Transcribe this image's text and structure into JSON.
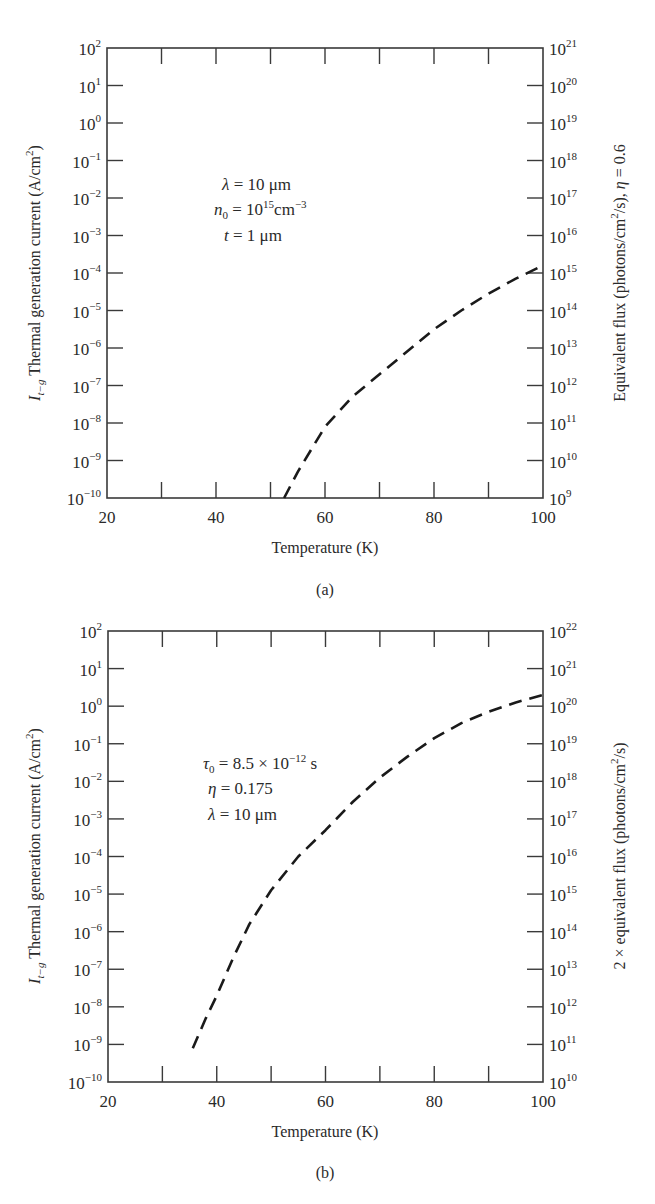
{
  "chart_data": [
    {
      "id": "a",
      "type": "line",
      "caption": "(a)",
      "xlabel": "Temperature (K)",
      "ylabel": "I_{t-g} Thermal generation current (A/cm^2)",
      "ylabel_right": "Equivalent flux (photons/cm^2/s), η = 0.6",
      "xlim": [
        20,
        100
      ],
      "ylim_log10": [
        -10,
        2
      ],
      "ylim_right_log10": [
        9,
        21
      ],
      "yscale": "log",
      "x_ticks": [
        20,
        40,
        60,
        80,
        100
      ],
      "x_minor_ticks": [
        30,
        50,
        70,
        90
      ],
      "y_tick_exponents": [
        2,
        1,
        0,
        -1,
        -2,
        -3,
        -4,
        -5,
        -6,
        -7,
        -8,
        -9,
        -10
      ],
      "y_right_tick_exponents": [
        21,
        20,
        19,
        18,
        17,
        16,
        15,
        14,
        13,
        12,
        11,
        10,
        9
      ],
      "annotations": [
        "λ = 10 μm",
        "n₀ = 10¹⁵ cm⁻³",
        "t = 1 μm"
      ],
      "series": [
        {
          "name": "thermal generation current",
          "style": "dashed",
          "x": [
            52.5,
            55,
            60,
            65,
            70,
            75,
            80,
            85,
            90,
            95,
            100
          ],
          "log10_y": [
            -10.0,
            -9.3,
            -8.1,
            -7.3,
            -6.7,
            -6.1,
            -5.5,
            -5.0,
            -4.55,
            -4.15,
            -3.8
          ]
        }
      ],
      "grid": false
    },
    {
      "id": "b",
      "type": "line",
      "caption": "(b)",
      "xlabel": "Temperature (K)",
      "ylabel": "I_{t-g} Thermal generation current (A/cm^2)",
      "ylabel_right": "2 × equivalent flux (photons/cm^2/s)",
      "xlim": [
        20,
        100
      ],
      "ylim_log10": [
        -10,
        2
      ],
      "ylim_right_log10": [
        10,
        22
      ],
      "yscale": "log",
      "x_ticks": [
        20,
        40,
        60,
        80,
        100
      ],
      "x_minor_ticks": [
        30,
        50,
        70,
        90
      ],
      "y_tick_exponents": [
        2,
        1,
        0,
        -1,
        -2,
        -3,
        -4,
        -5,
        -6,
        -7,
        -8,
        -9,
        -10
      ],
      "y_right_tick_exponents": [
        22,
        21,
        20,
        19,
        18,
        17,
        16,
        15,
        14,
        13,
        12,
        11,
        10
      ],
      "annotations": [
        "τ₀ = 8.5 × 10⁻¹² s",
        "η = 0.175",
        "λ = 10 μm"
      ],
      "series": [
        {
          "name": "thermal generation current",
          "style": "dashed",
          "x": [
            35.6,
            38,
            40,
            43,
            46,
            50,
            55,
            60,
            65,
            70,
            75,
            80,
            85,
            90,
            95,
            100
          ],
          "log10_y": [
            -9.1,
            -8.3,
            -7.7,
            -6.7,
            -5.8,
            -4.9,
            -4.0,
            -3.3,
            -2.55,
            -1.9,
            -1.35,
            -0.85,
            -0.45,
            -0.15,
            0.1,
            0.3
          ]
        }
      ],
      "grid": false
    }
  ],
  "labels": {
    "a": {
      "caption": "(a)",
      "xlabel": "Temperature (K)",
      "ylabel_symbol": "I",
      "ylabel_sub": "t−g",
      "ylabel_text": " Thermal generation current (A/cm",
      "ylabel_tail": ")",
      "ylabel_right_pre": "Equivalent flux (photons/cm",
      "ylabel_right_post": "/s), ",
      "ylabel_right_eta": "η",
      "ylabel_right_val": " = 0.6",
      "annot_1_sym": "λ",
      "annot_1_rest": " = 10 μm",
      "annot_2_sym": "n",
      "annot_2_sub": "0",
      "annot_2_mid": " = 10",
      "annot_2_sup": "15",
      "annot_2_unit": "cm",
      "annot_2_unit_sup": "−3",
      "annot_3_sym": "t",
      "annot_3_rest": " = 1 μm"
    },
    "b": {
      "caption": "(b)",
      "xlabel": "Temperature (K)",
      "ylabel_symbol": "I",
      "ylabel_sub": "t−g",
      "ylabel_text": " Thermal generation current (A/cm",
      "ylabel_tail": ")",
      "ylabel_right_pre": "2 × equivalent flux (photons/cm",
      "ylabel_right_post": "/s)",
      "annot_1_sym": "τ",
      "annot_1_sub": "0",
      "annot_1_mid": " = 8.5 × 10",
      "annot_1_sup": "−12",
      "annot_1_unit": " s",
      "annot_2_sym": "η",
      "annot_2_rest": " = 0.175",
      "annot_3_sym": "λ",
      "annot_3_rest": " = 10 μm"
    }
  }
}
